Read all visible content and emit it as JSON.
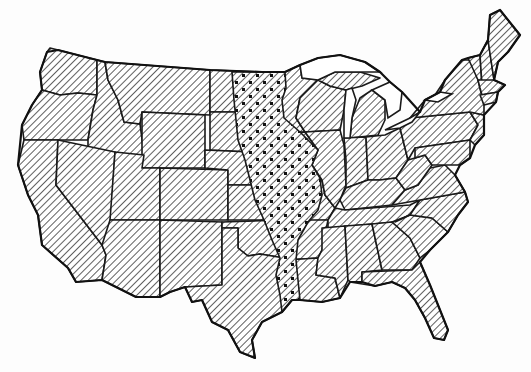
{
  "map": {
    "type": "choropleth-pattern",
    "subject": "Contiguous United States",
    "colors": {
      "background": "#ffffff",
      "stroke": "#1a1a1a",
      "hatch": "#2a2a2a"
    },
    "patterns": [
      {
        "id": "hatch",
        "description": "diagonal line hatching",
        "applies_to": "all states"
      },
      {
        "id": "hatchdots",
        "description": "diagonal hatching with dots",
        "applies_to": "central north-south band"
      }
    ],
    "dotted_states": [
      "North Dakota (east)",
      "South Dakota (east)",
      "Minnesota (west)",
      "Nebraska (east)",
      "Iowa",
      "Kansas (east)",
      "Missouri (west)",
      "Oklahoma (east)",
      "Arkansas (west)",
      "Texas (east)",
      "Louisiana (west)"
    ],
    "labels": []
  }
}
